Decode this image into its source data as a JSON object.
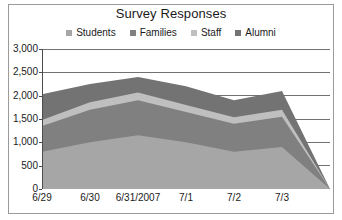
{
  "chart_data": {
    "type": "area",
    "stacked": true,
    "title": "Survey Responses",
    "xlabel": "",
    "ylabel": "",
    "categories": [
      "6/29",
      "6/30",
      "6/31/2007",
      "7/1",
      "7/2",
      "7/3",
      ""
    ],
    "ylim": [
      0,
      3000
    ],
    "ytick_labels": [
      "3,000",
      "2,500",
      "2,000",
      "1,500",
      "1,000",
      "500",
      "0"
    ],
    "ytick_values": [
      3000,
      2500,
      2000,
      1500,
      1000,
      500,
      0
    ],
    "grid": true,
    "legend_position": "top",
    "series": [
      {
        "name": "Students",
        "color": "#a6a6a6",
        "values": [
          800,
          1000,
          1150,
          1000,
          800,
          900,
          0
        ]
      },
      {
        "name": "Families",
        "color": "#808080",
        "values": [
          550,
          700,
          750,
          650,
          600,
          650,
          0
        ]
      },
      {
        "name": "Staff",
        "color": "#bfbfbf",
        "values": [
          130,
          160,
          170,
          150,
          140,
          150,
          0
        ]
      },
      {
        "name": "Alumni",
        "color": "#737373",
        "values": [
          550,
          390,
          330,
          400,
          360,
          400,
          0
        ]
      }
    ]
  },
  "chart": {
    "title": "Survey Responses"
  }
}
